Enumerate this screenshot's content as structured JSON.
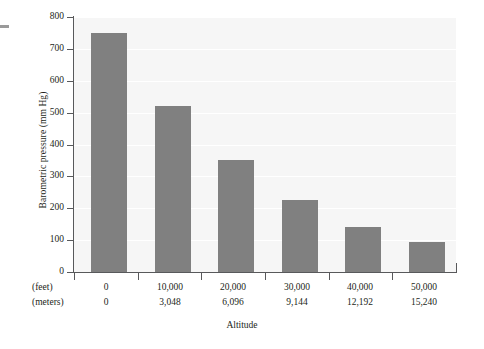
{
  "chart_data": {
    "type": "bar",
    "title": "",
    "xlabel": "Altitude",
    "ylabel": "Barometric pressure (mm Hg)",
    "categories": [
      "0",
      "10,000",
      "20,000",
      "30,000",
      "40,000",
      "50,000"
    ],
    "values": [
      750,
      520,
      350,
      225,
      140,
      95
    ],
    "ylim": [
      0,
      800
    ],
    "ytick_labels": [
      "800",
      "700",
      "600",
      "500",
      "400",
      "300",
      "200",
      "100",
      "0"
    ],
    "ytick_values": [
      800,
      700,
      600,
      500,
      400,
      300,
      200,
      100,
      0
    ],
    "grid": true,
    "legend": "none",
    "bar_color": "#808080",
    "plot_background": "#f6f6f6",
    "gridline_color": "#ffffff",
    "axis_color": "#58595b",
    "axis_rows": [
      {
        "name": "(feet)",
        "values": [
          "0",
          "10,000",
          "20,000",
          "30,000",
          "40,000",
          "50,000"
        ]
      },
      {
        "name": "(meters)",
        "values": [
          "0",
          "3,048",
          "6,096",
          "9,144",
          "12,192",
          "15,240"
        ]
      }
    ]
  }
}
